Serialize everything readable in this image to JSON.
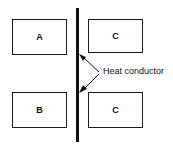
{
  "diagram": {
    "background_color": "#ffffff",
    "stroke_color": "#111111",
    "bodies": [
      {
        "id": "box-a",
        "label": "A",
        "position": "top-left"
      },
      {
        "id": "box-c1",
        "label": "C",
        "position": "top-right"
      },
      {
        "id": "box-b",
        "label": "B",
        "position": "bottom-left"
      },
      {
        "id": "box-c2",
        "label": "C",
        "position": "bottom-right"
      }
    ],
    "conductor": {
      "name": "heat-conductor-bar",
      "orientation": "vertical"
    },
    "annotation": {
      "label": "Heat conductor",
      "leader_vertex": {
        "x": 100,
        "y": 73
      },
      "arrow_targets": [
        {
          "x": 80,
          "y": 55
        },
        {
          "x": 80,
          "y": 92
        }
      ]
    }
  }
}
